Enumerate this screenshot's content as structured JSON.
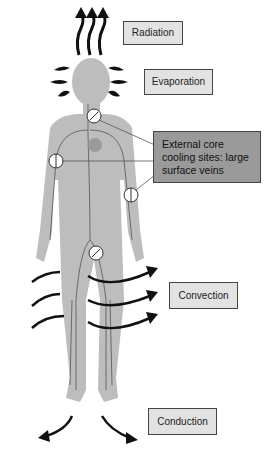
{
  "labels": {
    "radiation": "Radiation",
    "evaporation": "Evaporation",
    "cooling_sites": "External core\ncooling sites: large\nsurface veins",
    "convection": "Convection",
    "conduction": "Conduction"
  },
  "colors": {
    "body": "#bdbdbd",
    "veins": "#6a6a6a",
    "label_box": "#e2e2e2",
    "highlight_box": "#9a9a9a",
    "arrows": "#111111"
  }
}
